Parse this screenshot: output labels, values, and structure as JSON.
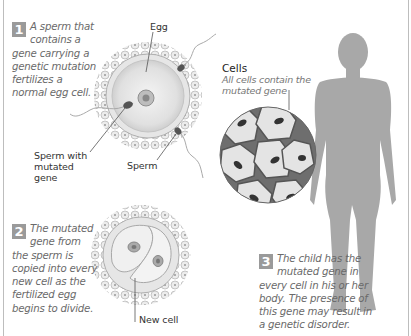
{
  "steps": [
    {
      "number": "1",
      "text": "A sperm that contains a gene carrying a genetic mutation fertilizes a normal egg cell."
    },
    {
      "number": "2",
      "text": "The mutated gene from the sperm is copied into every new cell as the fertilized egg begins to divide."
    },
    {
      "number": "3",
      "text": "The child has the mutated gene in every cell in his or her body. The presence of this gene may result in a genetic disorder."
    }
  ],
  "labels": {
    "egg": "Egg",
    "sperm_mutated": "Sperm with mutated gene",
    "sperm": "Sperm",
    "new_cell": "New cell",
    "cells_title": "Cells",
    "cells_subtitle": "All cells contain the mutated gene"
  },
  "colors": {
    "badge": "#9a9a9a",
    "body_silhouette": "#a8a8a8",
    "caption_text": "#6a6a6a",
    "frame": "#bdbdbd"
  }
}
